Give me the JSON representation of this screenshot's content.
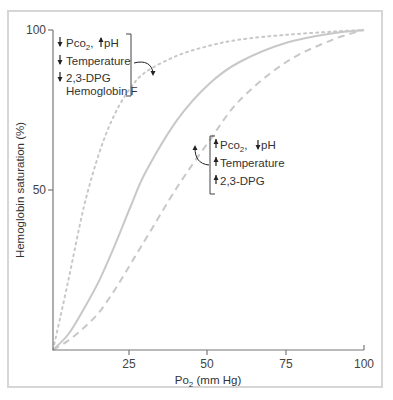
{
  "chart_data": {
    "type": "line",
    "title": "",
    "xlabel": "PO2 (mm Hg)",
    "ylabel": "Hemoglobin saturation (%)",
    "xlim": [
      0,
      100
    ],
    "ylim": [
      0,
      100
    ],
    "x_ticks": [
      25,
      50,
      75,
      100
    ],
    "y_ticks": [
      50,
      100
    ],
    "grid": false,
    "legend": null,
    "x": [
      0,
      5,
      10,
      15,
      20,
      25,
      30,
      40,
      50,
      60,
      75,
      90,
      100
    ],
    "series": [
      {
        "name": "Left shift (decreased PCO2, increased pH, decreased temperature, decreased 2,3-DPG, Hemoglobin F)",
        "style": "dotted",
        "values": [
          0,
          22,
          45,
          62,
          74,
          82,
          87,
          92,
          95,
          97,
          98.5,
          99.5,
          100
        ]
      },
      {
        "name": "Normal",
        "style": "solid",
        "values": [
          0,
          5,
          13,
          22,
          33,
          45,
          56,
          72,
          83,
          90,
          96,
          99,
          100
        ]
      },
      {
        "name": "Right shift (increased PCO2, decreased pH, increased temperature, increased 2,3-DPG)",
        "style": "dashed",
        "values": [
          0,
          3,
          7,
          12,
          19,
          27,
          35,
          51,
          65,
          78,
          90,
          97,
          100
        ]
      }
    ],
    "annotations": [
      {
        "position": "upper-left",
        "points_to": "dotted curve",
        "lines": [
          {
            "arrow": "down",
            "text": "PCO2,",
            "arrow2": "up",
            "text2": "pH"
          },
          {
            "arrow": "down",
            "text": "Temperature"
          },
          {
            "arrow": "down",
            "text": "2,3-DPG"
          },
          {
            "arrow": null,
            "text": "Hemoglobin F"
          }
        ]
      },
      {
        "position": "center-right",
        "points_to": "dashed curve",
        "lines": [
          {
            "arrow": "up",
            "text": "PCO2,",
            "arrow2": "down",
            "text2": "pH"
          },
          {
            "arrow": "up",
            "text": "Temperature"
          },
          {
            "arrow": "up",
            "text": "2,3-DPG"
          }
        ]
      }
    ]
  },
  "axes": {
    "x_tick_labels": [
      "25",
      "50",
      "75",
      "100"
    ],
    "y_tick_labels": [
      "50",
      "100"
    ],
    "x_title_main": "Po",
    "x_title_sub": "2",
    "x_title_rest": " (mm Hg)",
    "y_title": "Hemoglobin saturation (%)"
  },
  "annotation_left": {
    "line1_text": "Pco",
    "line1_sub": "2",
    "line1_comma": ",",
    "line1_text2": "pH",
    "line2_text": "Temperature",
    "line3_text": "2,3-DPG",
    "line4_text": "Hemoglobin F"
  },
  "annotation_right": {
    "line1_text": "Pco",
    "line1_sub": "2",
    "line1_comma": ",",
    "line1_text2": "pH",
    "line2_text": "Temperature",
    "line3_text": "2,3-DPG"
  },
  "colors": {
    "curve": "#c8c8c8",
    "axis": "#777777",
    "text": "#333333",
    "frame": "#d6d6d6"
  }
}
